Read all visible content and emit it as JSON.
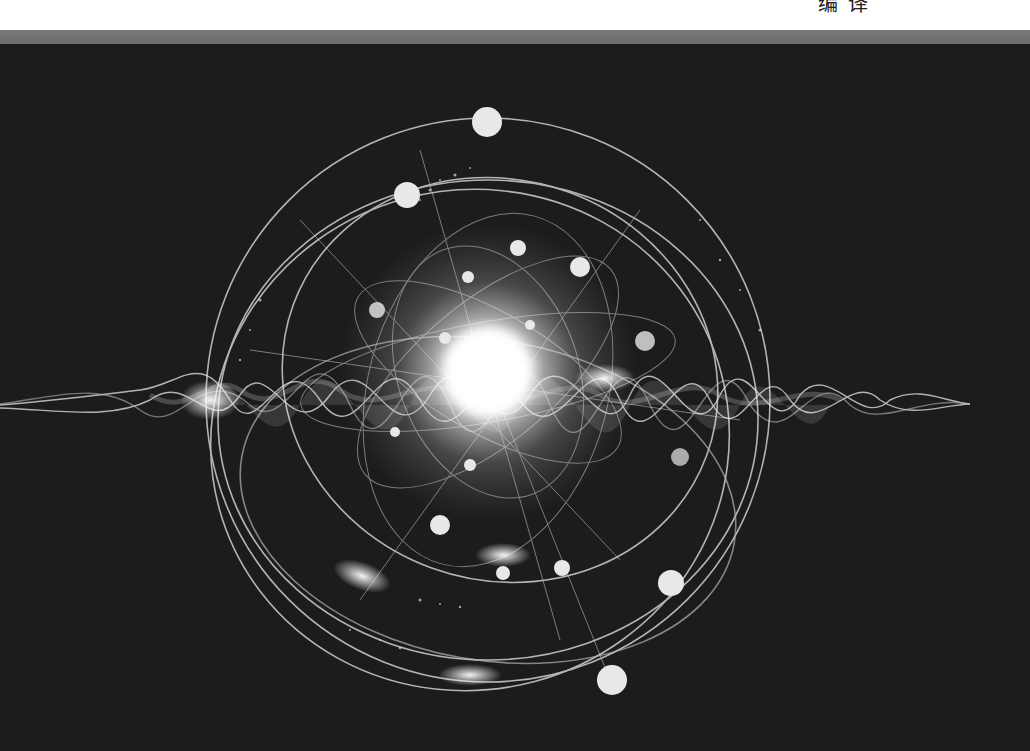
{
  "page": {
    "credit_text_partial": "编 译",
    "top_strip_color": "#ffffff",
    "band_color": "#707070",
    "background_color": "#1c1c1c"
  },
  "artwork": {
    "subject": "abstract quantum wave and atomic orbit illustration",
    "palette": "grayscale",
    "center": [
      488,
      372
    ],
    "orbit_count": 4,
    "glow_color": "#ffffff"
  }
}
